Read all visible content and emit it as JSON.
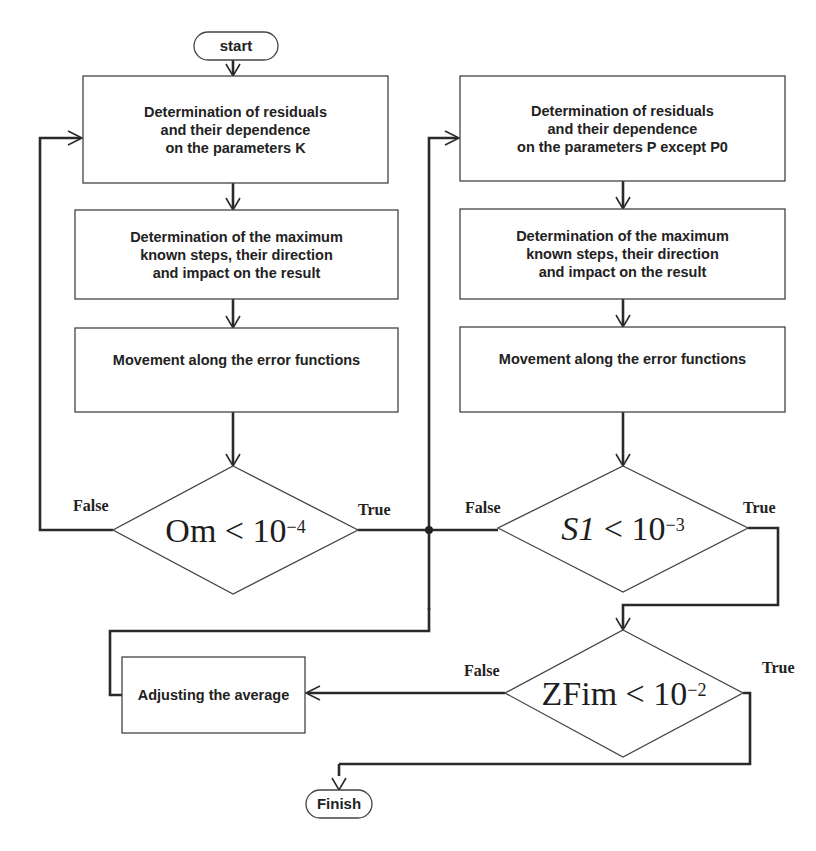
{
  "flowchart": {
    "start": "start",
    "finish": "Finish",
    "left_column": {
      "step1": "Determination of residuals\nand their dependence\non the parameters K",
      "step2": "Determination of the maximum\nknown steps, their direction\nand impact on the result",
      "step3": "Movement along the error functions",
      "decision": {
        "lhs": "Om",
        "op": "<",
        "base": "10",
        "exp": "−4",
        "false_label": "False",
        "true_label": "True"
      }
    },
    "right_column": {
      "step1": "Determination of residuals\nand their dependence\non the parameters P except P0",
      "step2": "Determination of the maximum\nknown steps, their direction\nand impact on the result",
      "step3": "Movement along the error functions",
      "decision": {
        "lhs": "S1",
        "op": "<",
        "base": "10",
        "exp": "−3",
        "false_label": "False",
        "true_label": "True"
      }
    },
    "final_decision": {
      "lhs": "ZFim",
      "op": "<",
      "base": "10",
      "exp": "−2",
      "false_label": "False",
      "true_label": "True"
    },
    "adjust_step": "Adjusting the average"
  }
}
